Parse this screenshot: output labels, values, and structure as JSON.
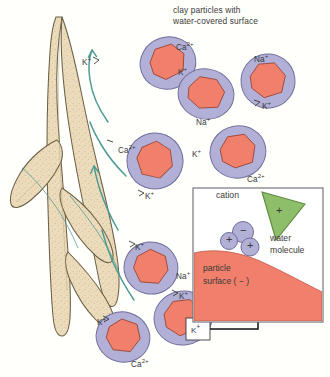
{
  "figure": {
    "title": "clay particles with\nwater-covered surface",
    "title_line1": "clay particles with",
    "title_line2": "water-covered surface"
  },
  "colors": {
    "background": "#fffffc",
    "root_fill": "#ecdcbb",
    "root_stroke": "#6b6048",
    "root_speckle": "#cbb68e",
    "particle_core": "#f07f6c",
    "particle_core_stroke": "#9c4a3c",
    "particle_halo": "#b2b0d6",
    "particle_halo_stroke": "#6f6e9c",
    "arrow_teal": "#4e9a94",
    "cation_green": "#8fbe6a",
    "cation_green_stroke": "#5e8a3e",
    "water_purple": "#b2b0d6",
    "water_purple_stroke": "#6f6e9c",
    "surface_salmon": "#f07f6c",
    "inset_border": "#6a6a72",
    "label_text": "#3a3a38",
    "connector": "#1a1a1a"
  },
  "particles": [
    {
      "id": "p1",
      "cx": 168,
      "cy": 63,
      "rx": 28,
      "ry": 26,
      "rot": -18,
      "label_top": "Ca",
      "label_top_charge": "2+"
    },
    {
      "id": "p2",
      "cx": 206,
      "cy": 94,
      "rx": 28,
      "ry": 25,
      "rot": 10,
      "label_left": "K",
      "label_left_charge": "+"
    },
    {
      "id": "p3",
      "cx": 268,
      "cy": 81,
      "rx": 27,
      "ry": 27,
      "rot": -8,
      "label_top": "Na",
      "label_top_charge": "+"
    },
    {
      "id": "p4",
      "cx": 155,
      "cy": 161,
      "rx": 28,
      "ry": 28,
      "rot": 22,
      "label_left": "Ca",
      "label_left_charge": "2+"
    },
    {
      "id": "p5",
      "cx": 238,
      "cy": 152,
      "rx": 28,
      "ry": 26,
      "rot": -12,
      "label_right": "Ca",
      "label_right_charge": "2+"
    },
    {
      "id": "p6",
      "cx": 151,
      "cy": 268,
      "rx": 27,
      "ry": 26,
      "rot": 14,
      "label_right": "Na",
      "label_right_charge": "+"
    },
    {
      "id": "p7",
      "cx": 183,
      "cy": 318,
      "rx": 29,
      "ry": 27,
      "rot": -10,
      "label_top": "K",
      "label_top_charge": "+"
    },
    {
      "id": "p8",
      "cx": 123,
      "cy": 337,
      "rx": 27,
      "ry": 25,
      "rot": 16,
      "label_right": "Ca",
      "label_right_charge": "2+"
    }
  ],
  "ion_labels": [
    {
      "name": "ca-2plus-top",
      "text": "Ca",
      "charge": "2+",
      "x": 176,
      "y": 43
    },
    {
      "name": "k-plus-upper-left",
      "text": "K",
      "charge": "+",
      "x": 82,
      "y": 58
    },
    {
      "name": "k-plus-center-upper",
      "text": "K",
      "charge": "+",
      "x": 178,
      "y": 68
    },
    {
      "name": "na-plus-top-right",
      "text": "Na",
      "charge": "+",
      "x": 254,
      "y": 55
    },
    {
      "name": "k-plus-right-mid",
      "text": "K",
      "charge": "+",
      "x": 262,
      "y": 102
    },
    {
      "name": "na-plus-mid",
      "text": "Na",
      "charge": "+",
      "x": 196,
      "y": 118
    },
    {
      "name": "ca-2plus-left-mid",
      "text": "Ca",
      "charge": "2+",
      "x": 118,
      "y": 146
    },
    {
      "name": "k-plus-mid-center",
      "text": "K",
      "charge": "+",
      "x": 192,
      "y": 150
    },
    {
      "name": "ca-2plus-right-mid",
      "text": "Ca",
      "charge": "2+",
      "x": 247,
      "y": 175
    },
    {
      "name": "k-plus-lower-left",
      "text": "K",
      "charge": "+",
      "x": 145,
      "y": 192
    },
    {
      "name": "k-plus-lower-center",
      "text": "K",
      "charge": "+",
      "x": 135,
      "y": 243
    },
    {
      "name": "na-plus-lower",
      "text": "Na",
      "charge": "+",
      "x": 176,
      "y": 272
    },
    {
      "name": "k-plus-lower-right",
      "text": "K",
      "charge": "+",
      "x": 179,
      "y": 292
    },
    {
      "name": "k-plus-bottom-left",
      "text": "K",
      "charge": "+",
      "x": 97,
      "y": 318
    },
    {
      "name": "ca-2plus-bottom",
      "text": "Ca",
      "charge": "2+",
      "x": 131,
      "y": 360
    }
  ],
  "callout": {
    "boxed_ion": "K",
    "boxed_ion_charge": "+",
    "box_x": 186,
    "box_y": 318,
    "box_w": 24,
    "box_h": 22
  },
  "inset": {
    "x": 193,
    "y": 188,
    "width": 130,
    "height": 134,
    "cation_label": "cation",
    "water_label_line1": "water",
    "water_label_line2": "molecule",
    "surface_label_line1": "particle",
    "surface_label_line2": "surface ( − )",
    "cation_charge": "+",
    "water_negative": "−",
    "water_positive_1": "+",
    "water_positive_2": "+"
  }
}
